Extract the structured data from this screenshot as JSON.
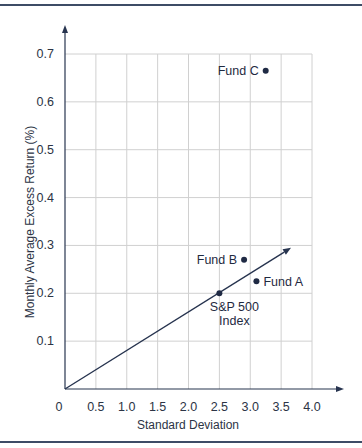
{
  "chart_data": {
    "type": "scatter",
    "title": "",
    "xlabel": "Standard Deviation",
    "ylabel": "Monthly Average Excess Return (%)",
    "xlim": [
      0,
      4.0
    ],
    "ylim": [
      0,
      0.7
    ],
    "grid": true,
    "x_ticks": [
      "0",
      "0.5",
      "1.0",
      "1.5",
      "2.0",
      "2.5",
      "3.0",
      "3.5",
      "4.0"
    ],
    "x_tick_values": [
      0,
      0.5,
      1.0,
      1.5,
      2.0,
      2.5,
      3.0,
      3.5,
      4.0
    ],
    "y_ticks": [
      "0.1",
      "0.2",
      "0.3",
      "0.4",
      "0.5",
      "0.6",
      "0.7"
    ],
    "y_tick_values": [
      0.1,
      0.2,
      0.3,
      0.4,
      0.5,
      0.6,
      0.7
    ],
    "points": [
      {
        "name": "Fund A",
        "label": "Fund A",
        "x": 3.1,
        "y": 0.225,
        "label_side": "right"
      },
      {
        "name": "Fund B",
        "label": "Fund B",
        "x": 2.9,
        "y": 0.27,
        "label_side": "left"
      },
      {
        "name": "Fund C",
        "label": "Fund C",
        "x": 3.25,
        "y": 0.665,
        "label_side": "left"
      },
      {
        "name": "S&P 500 Index",
        "label_lines": [
          "S&P 500",
          "Index"
        ],
        "x": 2.5,
        "y": 0.2,
        "label_side": "below"
      }
    ],
    "capital_market_line": {
      "from": [
        0,
        0
      ],
      "through": [
        2.5,
        0.2
      ],
      "to": [
        3.66,
        0.295
      ]
    },
    "colors": {
      "line": "#27344f",
      "point": "#1f2a44",
      "grid": "#d0d0d0",
      "frame": "#3d4c66"
    }
  }
}
